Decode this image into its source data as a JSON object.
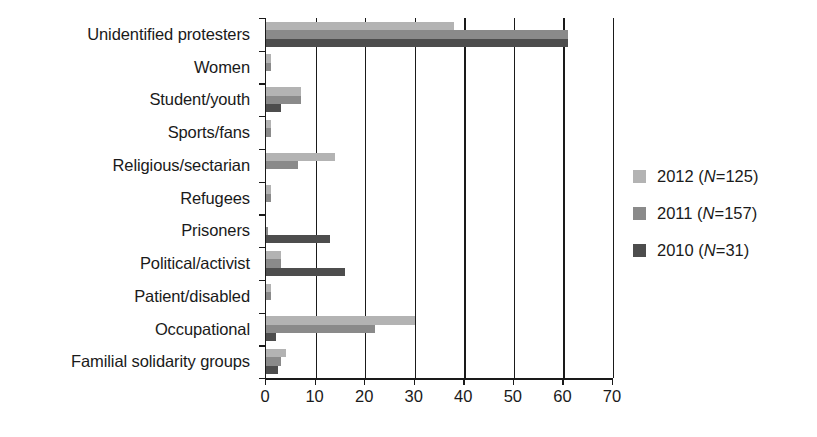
{
  "chart_data": {
    "type": "bar",
    "orientation": "horizontal",
    "title": "",
    "xlabel": "",
    "ylabel": "",
    "xlim": [
      0,
      70
    ],
    "xticks": [
      0,
      10,
      20,
      30,
      40,
      50,
      60,
      70
    ],
    "xtick_labels": [
      "0",
      "10",
      "20",
      "30",
      "40",
      "50",
      "60",
      "70"
    ],
    "grid": "vertical",
    "legend_position": "right",
    "categories": [
      "Unidentified protesters",
      "Women",
      "Student/youth",
      "Sports/fans",
      "Religious/sectarian",
      "Refugees",
      "Prisoners",
      "Political/activist",
      "Patient/disabled",
      "Occupational",
      "Familial solidarity groups"
    ],
    "series": [
      {
        "name": "2012",
        "legend_label": "2012 (N=125)",
        "legend_year": "2012",
        "legend_n": "125",
        "color": "#b3b3b3",
        "values": [
          38,
          1,
          7,
          1,
          14,
          1,
          0,
          3,
          1,
          30,
          4
        ]
      },
      {
        "name": "2011",
        "legend_label": "2011 (N=157)",
        "legend_year": "2011",
        "legend_n": "157",
        "color": "#8a8a8a",
        "values": [
          61,
          1,
          7,
          1,
          6.5,
          1,
          0.5,
          3,
          1,
          22,
          3
        ]
      },
      {
        "name": "2010",
        "legend_label": "2010 (N=31)",
        "legend_year": "2010",
        "legend_n": "31",
        "color": "#4d4d4d",
        "values": [
          61,
          0,
          3,
          0,
          0,
          0,
          13,
          16,
          0,
          2,
          2.5
        ]
      }
    ]
  },
  "legend": {
    "entries": [
      {
        "year": "2012",
        "n": "125",
        "color": "#b3b3b3"
      },
      {
        "year": "2011",
        "n": "157",
        "color": "#8a8a8a"
      },
      {
        "year": "2010",
        "n": "31",
        "color": "#4d4d4d"
      }
    ]
  },
  "axis": {
    "x_tick_labels": [
      "0",
      "10",
      "20",
      "30",
      "40",
      "50",
      "60",
      "70"
    ]
  }
}
